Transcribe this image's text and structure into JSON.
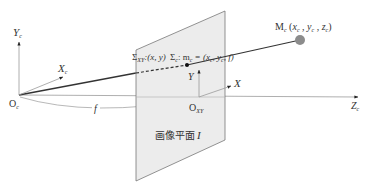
{
  "diagram": {
    "type": "pinhole camera projection model",
    "colors": {
      "background": "#ffffff",
      "plane_fill": "#e8e8e8",
      "plane_edge": "#777777",
      "axis": "#999999",
      "projection_ray": "#333333",
      "point": "#8c8c8c"
    },
    "camera_frame": {
      "origin": {
        "main": "O",
        "sub": "c"
      },
      "y_axis": {
        "main": "Y",
        "sub": "c"
      },
      "x_axis": {
        "main": "X",
        "sub": "c"
      },
      "z_axis": {
        "main": "Z",
        "sub": "c"
      }
    },
    "image_plane": {
      "label": "画像平面",
      "label_symbol": "I",
      "origin": {
        "main": "O",
        "sub": "XY"
      },
      "x_axis": "X",
      "y_axis": "Y"
    },
    "focal_length": "f",
    "plane_caption": {
      "sigma_xy": {
        "main": "Σ",
        "sub": "XY",
        "text": ":(x, y)"
      },
      "sigma_c": {
        "main": "Σ",
        "sub": "c",
        "text": ": m",
        "m_sub": "c",
        "eq": " = (x",
        "x_sub": "c",
        "sep": ", y",
        "y_sub": "c",
        "tail": ", f)"
      }
    },
    "world_point": {
      "label": "M",
      "label_sub": "c",
      "coords": [
        "x",
        "y",
        "z"
      ],
      "coord_sub": "c"
    }
  }
}
